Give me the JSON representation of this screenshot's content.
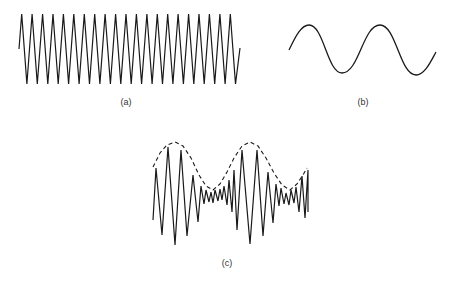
{
  "figure": {
    "panels": [
      {
        "id": "a",
        "label": "(a)",
        "description": "high-frequency carrier wave (triangle/sawtooth-like zigzag)",
        "label_pos": [
          126,
          98
        ],
        "start": [
          19,
          49
        ],
        "end": [
          240,
          48
        ],
        "first_peak_x": 21.7,
        "period": 10.43,
        "peak_count": 21,
        "peak_y": 14,
        "trough_y": 84
      },
      {
        "id": "b",
        "label": "(b)",
        "description": "low-frequency modulating sine wave",
        "label_pos": [
          363,
          98
        ],
        "points": [
          [
            289,
            50
          ],
          [
            309,
            25
          ],
          [
            342,
            73
          ],
          [
            380,
            25
          ],
          [
            416,
            75
          ],
          [
            436,
            52
          ]
        ]
      },
      {
        "id": "c",
        "label": "(c)",
        "description": "amplitude-modulated wave with dashed envelope",
        "label_pos": [
          227,
          259
        ],
        "signal_points": [
          [
            153,
            220
          ],
          [
            156,
            168
          ],
          [
            162,
            235
          ],
          [
            168,
            147
          ],
          [
            175,
            245
          ],
          [
            181,
            150
          ],
          [
            187,
            236
          ],
          [
            193,
            175
          ],
          [
            198,
            222
          ],
          [
            201,
            186
          ],
          [
            204,
            204
          ],
          [
            206,
            190
          ],
          [
            209,
            202
          ],
          [
            211,
            192
          ],
          [
            213,
            203
          ],
          [
            215,
            190
          ],
          [
            218,
            201
          ],
          [
            220,
            189
          ],
          [
            222,
            200
          ],
          [
            224,
            186
          ],
          [
            227,
            205
          ],
          [
            229,
            180
          ],
          [
            232,
            212
          ],
          [
            234,
            170
          ],
          [
            237,
            230
          ],
          [
            242,
            150
          ],
          [
            250,
            244
          ],
          [
            257,
            150
          ],
          [
            263,
            236
          ],
          [
            268,
            172
          ],
          [
            273,
            223
          ],
          [
            276,
            184
          ],
          [
            279,
            206
          ],
          [
            281,
            188
          ],
          [
            284,
            204
          ],
          [
            286,
            193
          ],
          [
            289,
            205
          ],
          [
            291,
            190
          ],
          [
            294,
            203
          ],
          [
            296,
            187
          ],
          [
            299,
            212
          ],
          [
            302,
            176
          ],
          [
            305,
            218
          ],
          [
            308,
            170
          ],
          [
            308,
            212
          ]
        ],
        "envelope_points": [
          [
            153,
            167
          ],
          [
            160,
            153
          ],
          [
            167,
            145
          ],
          [
            175,
            142
          ],
          [
            183,
            146
          ],
          [
            191,
            158
          ],
          [
            199,
            175
          ],
          [
            206,
            186
          ],
          [
            213,
            190
          ],
          [
            220,
            184
          ],
          [
            227,
            172
          ],
          [
            234,
            158
          ],
          [
            242,
            146
          ],
          [
            250,
            142
          ],
          [
            258,
            146
          ],
          [
            266,
            158
          ],
          [
            274,
            173
          ],
          [
            282,
            185
          ],
          [
            290,
            190
          ],
          [
            297,
            184
          ],
          [
            303,
            175
          ],
          [
            307,
            168
          ]
        ]
      }
    ],
    "colors": {
      "stroke": "#1a1a1a",
      "label": "#333333",
      "background": "#ffffff"
    }
  }
}
